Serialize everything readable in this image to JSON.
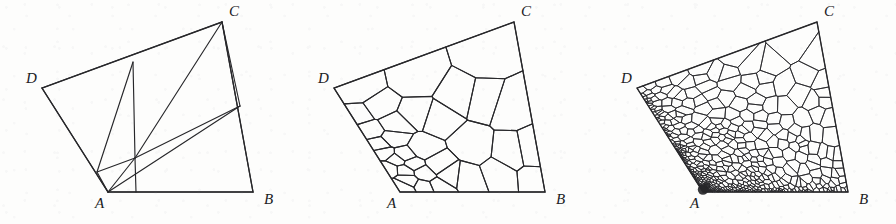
{
  "figure": {
    "kind": "scanned-figure",
    "background_color": "#fdfdfc",
    "line_color": "#27272a",
    "label_color": "#20201e"
  },
  "geometry": {
    "vertices": {
      "A": [
        108,
        192
      ],
      "B": [
        253,
        192
      ],
      "C": [
        222,
        22
      ],
      "D": [
        42,
        88
      ]
    },
    "label_offsets": {
      "A": [
        -13,
        16
      ],
      "B": [
        11,
        12
      ],
      "C": [
        7,
        -6
      ],
      "D": [
        -16,
        -5
      ]
    }
  },
  "panels": [
    {
      "id": "panel-coarse",
      "offset_x": 0,
      "stage": 1,
      "mesh_type": "triangulation",
      "refinement_level": 0,
      "labels": {
        "A": "A",
        "B": "B",
        "C": "C",
        "D": "D"
      },
      "interior_nodes": [
        [
          135,
          158
        ],
        [
          97,
          172
        ],
        [
          133,
          62
        ],
        [
          240,
          106
        ]
      ],
      "edges": [
        [
          [
            42,
            88
          ],
          [
            108,
            192
          ]
        ],
        [
          [
            108,
            192
          ],
          [
            253,
            192
          ]
        ],
        [
          [
            253,
            192
          ],
          [
            222,
            22
          ]
        ],
        [
          [
            222,
            22
          ],
          [
            42,
            88
          ]
        ],
        [
          [
            133,
            62
          ],
          [
            135,
            158
          ]
        ],
        [
          [
            133,
            62
          ],
          [
            97,
            172
          ]
        ],
        [
          [
            135,
            158
          ],
          [
            222,
            22
          ]
        ],
        [
          [
            135,
            158
          ],
          [
            97,
            172
          ]
        ],
        [
          [
            135,
            158
          ],
          [
            108,
            192
          ]
        ],
        [
          [
            135,
            158
          ],
          [
            240,
            106
          ]
        ],
        [
          [
            108,
            192
          ],
          [
            240,
            106
          ]
        ],
        [
          [
            240,
            106
          ],
          [
            222,
            22
          ]
        ],
        [
          [
            97,
            172
          ],
          [
            108,
            192
          ]
        ],
        [
          [
            135,
            158
          ],
          [
            136,
            192
          ]
        ]
      ]
    },
    {
      "id": "panel-medium",
      "offset_x": 292,
      "stage": 2,
      "mesh_type": "polygonal-voronoi",
      "refinement_level": 1,
      "labels": {
        "A": "A",
        "B": "B",
        "C": "C",
        "D": "D"
      },
      "seed": 20407,
      "cell_count": 34
    },
    {
      "id": "panel-fine",
      "offset_x": 595,
      "stage": 3,
      "mesh_type": "polygonal-voronoi",
      "refinement_level": 2,
      "labels": {
        "A": "A",
        "B": "B",
        "C": "C",
        "D": "D"
      },
      "seed": 91113,
      "cell_count": 620,
      "singular_corner": "A"
    }
  ]
}
